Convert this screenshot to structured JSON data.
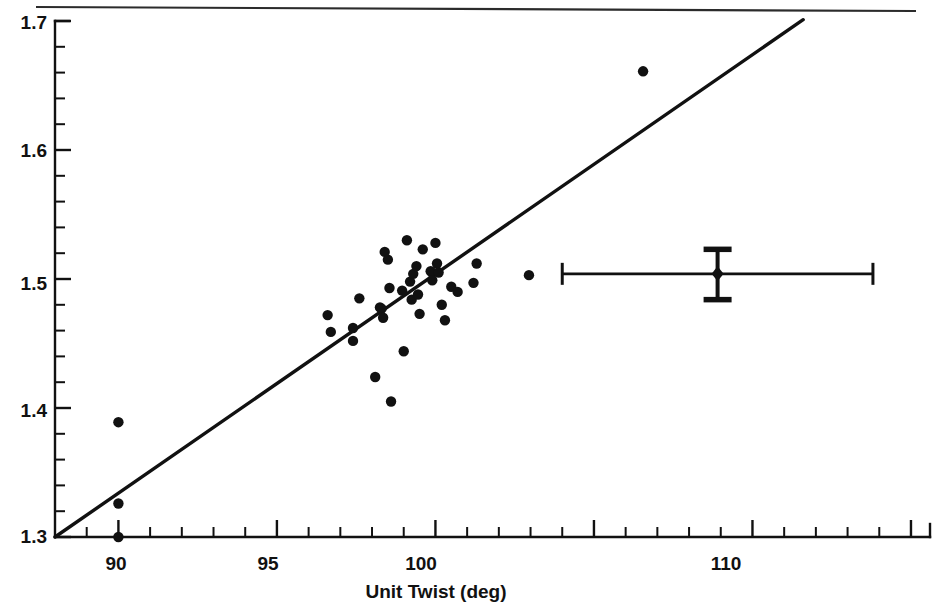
{
  "figure": {
    "title": "",
    "background": "#ffffff",
    "ink_color": "#111111"
  },
  "axes": {
    "x_title": "Unit Twist (deg)",
    "y_title": "",
    "x_tick_labels": [
      "90",
      "95",
      "100",
      "110"
    ],
    "y_tick_labels": [
      "1.3",
      "1.4",
      "1.5",
      "1.6",
      "1.7"
    ]
  },
  "labels": {
    "x_90": "90",
    "x_95": "95",
    "x_100": "100",
    "x_110": "110",
    "y_13": "1.3",
    "y_14": "1.4",
    "y_15": "1.5",
    "y_16": "1.6",
    "y_17": "1.7",
    "x_axis_title": "Unit Twist (deg)"
  },
  "chart_data": {
    "type": "scatter",
    "title": "",
    "xlabel": "Unit Twist (deg)",
    "ylabel": "",
    "xlim": [
      88.0,
      115.6
    ],
    "ylim": [
      1.3,
      1.7
    ],
    "grid": false,
    "legend": null,
    "x_major_ticks": [
      90,
      95,
      100,
      105,
      110,
      115
    ],
    "x_labeled_ticks": [
      90,
      95,
      100,
      110
    ],
    "x_minor_tick_step": 1,
    "y_major_ticks": [
      1.3,
      1.4,
      1.5,
      1.6,
      1.7
    ],
    "y_minor_tick_step": 0.02,
    "points": [
      {
        "x": 90.0,
        "y": 1.389
      },
      {
        "x": 90.0,
        "y": 1.326
      },
      {
        "x": 90.0,
        "y": 1.3
      },
      {
        "x": 96.6,
        "y": 1.472
      },
      {
        "x": 96.7,
        "y": 1.459
      },
      {
        "x": 97.4,
        "y": 1.462
      },
      {
        "x": 97.4,
        "y": 1.452
      },
      {
        "x": 97.6,
        "y": 1.485
      },
      {
        "x": 98.1,
        "y": 1.424
      },
      {
        "x": 98.25,
        "y": 1.478
      },
      {
        "x": 98.3,
        "y": 1.477
      },
      {
        "x": 98.35,
        "y": 1.47
      },
      {
        "x": 98.4,
        "y": 1.521
      },
      {
        "x": 98.5,
        "y": 1.515
      },
      {
        "x": 98.55,
        "y": 1.493
      },
      {
        "x": 98.6,
        "y": 1.405
      },
      {
        "x": 98.95,
        "y": 1.491
      },
      {
        "x": 99.0,
        "y": 1.444
      },
      {
        "x": 99.1,
        "y": 1.53
      },
      {
        "x": 99.2,
        "y": 1.498
      },
      {
        "x": 99.25,
        "y": 1.484
      },
      {
        "x": 99.3,
        "y": 1.504
      },
      {
        "x": 99.4,
        "y": 1.51
      },
      {
        "x": 99.45,
        "y": 1.488
      },
      {
        "x": 99.5,
        "y": 1.473
      },
      {
        "x": 99.6,
        "y": 1.523
      },
      {
        "x": 99.85,
        "y": 1.506
      },
      {
        "x": 99.9,
        "y": 1.499
      },
      {
        "x": 100.0,
        "y": 1.528
      },
      {
        "x": 100.05,
        "y": 1.512
      },
      {
        "x": 100.1,
        "y": 1.505
      },
      {
        "x": 100.2,
        "y": 1.48
      },
      {
        "x": 100.3,
        "y": 1.468
      },
      {
        "x": 100.5,
        "y": 1.494
      },
      {
        "x": 100.7,
        "y": 1.49
      },
      {
        "x": 101.2,
        "y": 1.497
      },
      {
        "x": 101.3,
        "y": 1.512
      },
      {
        "x": 102.95,
        "y": 1.503
      },
      {
        "x": 106.55,
        "y": 1.661
      }
    ],
    "fit_line": {
      "label": "linear fit",
      "x": [
        88.0,
        111.6
      ],
      "y": [
        1.3,
        1.701
      ]
    },
    "error_bar_marker": {
      "label": "mean with error bars",
      "x": 108.9,
      "y": 1.504,
      "x_err_low": 104.0,
      "x_err_high": 113.8,
      "y_err_low": 1.484,
      "y_err_high": 1.523,
      "marker": "diamond"
    }
  }
}
